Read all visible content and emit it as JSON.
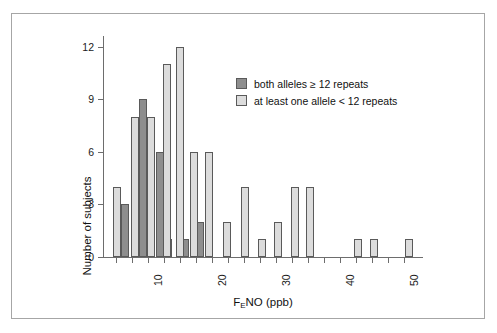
{
  "chart_data": {
    "type": "bar",
    "title": "",
    "subtitle": "",
    "xlabel": "FENO (ppb)",
    "xlabel_parts": {
      "pre": "F",
      "sub": "E",
      "post": "NO (ppb)"
    },
    "ylabel": "Number of subjects",
    "xlim": [
      3,
      53
    ],
    "ylim": [
      0,
      12.6
    ],
    "yticks": [
      0,
      3,
      6,
      9,
      12
    ],
    "ytick_labels": [
      "0",
      "3",
      "6",
      "9",
      "12"
    ],
    "xticks": [
      5,
      7.5,
      10,
      12.5,
      15,
      17.5,
      20,
      22.5,
      25,
      27.5,
      30,
      32.5,
      35,
      37.5,
      40,
      42.5,
      45,
      47.5,
      50
    ],
    "xtick_labels_major": [
      {
        "x": 10,
        "label": "10"
      },
      {
        "x": 20,
        "label": "20"
      },
      {
        "x": 30,
        "label": "30"
      },
      {
        "x": 40,
        "label": "40"
      },
      {
        "x": 50,
        "label": "50"
      }
    ],
    "grid": false,
    "legend_position": "upper right",
    "legend": [
      {
        "key": "dark",
        "label": "both alleles ≥ 12 repeats",
        "color": "#8e8e8e"
      },
      {
        "key": "light",
        "label": "at least one allele < 12 repeats",
        "color": "#dcdcdc"
      }
    ],
    "series": [
      {
        "name": "both alleles ≥ 12 repeats",
        "key": "dark",
        "color": "#8e8e8e",
        "points": [
          {
            "x": 6.4,
            "y": 3
          },
          {
            "x": 9.3,
            "y": 9
          },
          {
            "x": 11.9,
            "y": 6
          },
          {
            "x": 13.2,
            "y": 1
          },
          {
            "x": 15.8,
            "y": 1
          },
          {
            "x": 18.1,
            "y": 2
          }
        ]
      },
      {
        "name": "at least one allele < 12 repeats",
        "key": "light",
        "color": "#dcdcdc",
        "points": [
          {
            "x": 5.2,
            "y": 4
          },
          {
            "x": 8.0,
            "y": 8
          },
          {
            "x": 10.5,
            "y": 8
          },
          {
            "x": 13.0,
            "y": 11
          },
          {
            "x": 15.0,
            "y": 12
          },
          {
            "x": 17.2,
            "y": 6
          },
          {
            "x": 19.5,
            "y": 6
          },
          {
            "x": 22.4,
            "y": 2
          },
          {
            "x": 25.2,
            "y": 4
          },
          {
            "x": 27.9,
            "y": 1
          },
          {
            "x": 30.3,
            "y": 2
          },
          {
            "x": 33.0,
            "y": 4
          },
          {
            "x": 35.4,
            "y": 4
          },
          {
            "x": 42.8,
            "y": 1
          },
          {
            "x": 45.4,
            "y": 1
          },
          {
            "x": 50.8,
            "y": 1
          }
        ]
      }
    ]
  }
}
